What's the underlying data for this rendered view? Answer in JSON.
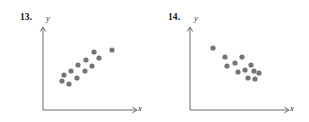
{
  "page": {
    "background_color": "#ffffff"
  },
  "style": {
    "axis_color": "#6b6b6b",
    "dot_color": "#757575",
    "dot_radius": 2.6,
    "number_color": "#1a1a1a",
    "label_color": "#2b2b2b"
  },
  "figures": [
    {
      "id": "13",
      "number_label": "13.",
      "y_axis_label": "y",
      "x_axis_label": "x",
      "axes": {
        "origin_x": 43,
        "origin_y": 110,
        "y_top": 27,
        "x_right": 137
      },
      "chart_data": {
        "type": "scatter",
        "title": "13.",
        "xlabel": "x",
        "ylabel": "y",
        "grid": false,
        "legend": null,
        "axis_ticks": false,
        "trend": "positive linear association",
        "xlim": [
          43,
          137
        ],
        "ylim": [
          27,
          110
        ],
        "points": [
          {
            "x": 62,
            "y": 81
          },
          {
            "x": 64,
            "y": 75
          },
          {
            "x": 69,
            "y": 84
          },
          {
            "x": 71,
            "y": 71
          },
          {
            "x": 77,
            "y": 78
          },
          {
            "x": 78,
            "y": 65
          },
          {
            "x": 85,
            "y": 71
          },
          {
            "x": 86,
            "y": 60
          },
          {
            "x": 92,
            "y": 66
          },
          {
            "x": 94,
            "y": 52
          },
          {
            "x": 99,
            "y": 58
          },
          {
            "x": 112,
            "y": 50
          }
        ]
      }
    },
    {
      "id": "14",
      "number_label": "14.",
      "y_axis_label": "y",
      "x_axis_label": "x",
      "axes": {
        "origin_x": 35,
        "origin_y": 110,
        "y_top": 27,
        "x_right": 134
      },
      "chart_data": {
        "type": "scatter",
        "title": "14.",
        "xlabel": "x",
        "ylabel": "y",
        "grid": false,
        "legend": null,
        "axis_ticks": false,
        "trend": "negative linear association",
        "xlim": [
          35,
          134
        ],
        "ylim": [
          27,
          110
        ],
        "points": [
          {
            "x": 58,
            "y": 48
          },
          {
            "x": 70,
            "y": 57
          },
          {
            "x": 72,
            "y": 66
          },
          {
            "x": 80,
            "y": 63
          },
          {
            "x": 83,
            "y": 72
          },
          {
            "x": 87,
            "y": 57
          },
          {
            "x": 90,
            "y": 70
          },
          {
            "x": 93,
            "y": 78
          },
          {
            "x": 96,
            "y": 65
          },
          {
            "x": 99,
            "y": 71
          },
          {
            "x": 100,
            "y": 79
          },
          {
            "x": 104,
            "y": 73
          }
        ]
      }
    }
  ]
}
